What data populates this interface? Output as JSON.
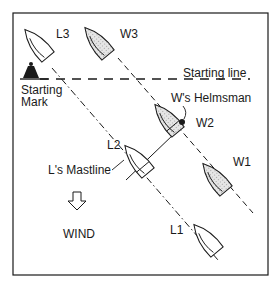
{
  "diagram": {
    "title": "",
    "labels": {
      "l3": "L3",
      "w3": "W3",
      "starting_mark_line1": "Starting",
      "starting_mark_line2": "Mark",
      "starting_line": "Starting line",
      "w_helmsman": "W's Helmsman",
      "w2": "W2",
      "l2": "L2",
      "l_mastline": "L's Mastline",
      "w1": "W1",
      "wind": "WIND",
      "l1": "L1"
    },
    "colors": {
      "stroke": "#1a1a1a",
      "shaded_fill": "#d4d4d4",
      "boat_fill": "#ffffff"
    }
  }
}
